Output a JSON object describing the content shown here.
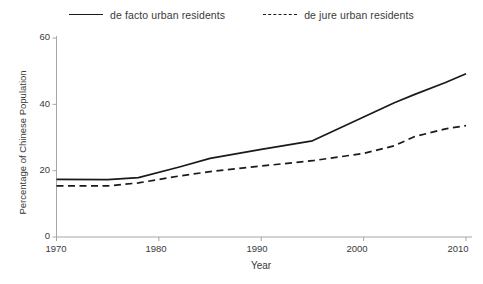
{
  "chart_data": {
    "type": "line",
    "title": "",
    "xlabel": "Year",
    "ylabel": "Percentage of Chinese Population",
    "xlim": [
      1970,
      2010
    ],
    "ylim": [
      0,
      60
    ],
    "xticks": [
      "1970",
      "1980",
      "1990",
      "2000",
      "2010"
    ],
    "yticks": [
      "0",
      "20",
      "40",
      "60"
    ],
    "grid": false,
    "legend_position": "top-center",
    "x": [
      1970,
      1975,
      1978,
      1982,
      1985,
      1990,
      1995,
      2000,
      2003,
      2005,
      2008,
      2010
    ],
    "series": [
      {
        "name": "de facto urban residents",
        "style": "solid",
        "color": "#1a1a1a",
        "values": [
          17.4,
          17.3,
          17.9,
          21.1,
          23.7,
          26.4,
          29.0,
          36.2,
          40.5,
          43.0,
          46.6,
          49.2
        ]
      },
      {
        "name": "de jure urban residents",
        "style": "dashed",
        "color": "#1a1a1a",
        "values": [
          15.4,
          15.4,
          16.3,
          18.4,
          19.7,
          21.4,
          23.0,
          25.2,
          27.5,
          30.3,
          32.6,
          33.6
        ]
      }
    ]
  },
  "legend": {
    "entries": [
      {
        "label": "de facto urban residents",
        "style": "solid"
      },
      {
        "label": "de jure urban residents",
        "style": "dashed"
      }
    ]
  },
  "axes": {
    "x_title": "Year",
    "y_title": "Percentage of Chinese Population",
    "y_tick_60": "60",
    "y_tick_40": "40",
    "y_tick_20": "20",
    "y_tick_0": "0",
    "x_tick_1970": "1970",
    "x_tick_1980": "1980",
    "x_tick_1990": "1990",
    "x_tick_2000": "2000",
    "x_tick_2010": "2010"
  },
  "colors": {
    "line": "#1a1a1a",
    "axis": "#a6a6a6",
    "text": "#3a3a3a",
    "background": "#ffffff"
  }
}
